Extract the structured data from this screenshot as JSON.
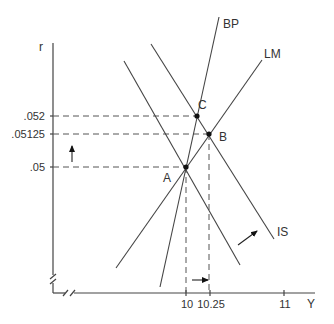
{
  "diagram": {
    "axes": {
      "y_label": "r",
      "x_label": "Y",
      "y_ticks": [
        ".052",
        ".05125",
        ".05"
      ],
      "x_ticks": [
        "10",
        "10.25",
        "11"
      ]
    },
    "curves": {
      "bp": "BP",
      "lm": "LM",
      "is": "IS"
    },
    "points": {
      "a": "A",
      "b": "B",
      "c": "C"
    },
    "annotations": {
      "r_shift": "up-arrow",
      "y_shift": "right-arrow",
      "is_shift": "up-right-arrow"
    },
    "colors": {
      "line": "#444444",
      "point": "#111111",
      "background": "#ffffff"
    }
  }
}
